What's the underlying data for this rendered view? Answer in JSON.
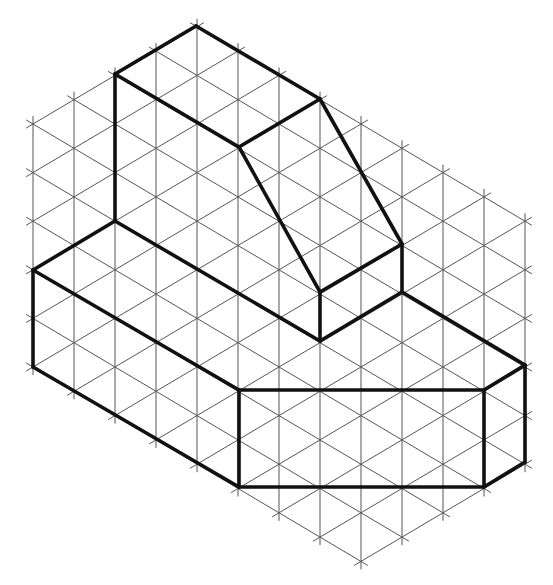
{
  "diagram": {
    "type": "isometric-drawing",
    "background_color": "#ffffff",
    "grid": {
      "origin_x": 33,
      "origin_y": 124,
      "column_spacing": 41,
      "row_height": 48.6,
      "columns": 12,
      "rows": 13,
      "region": "0<=u<=12, m>=0, m>=u-4, m<=13, m<=u+5",
      "line_color": "#555555",
      "line_width": 1,
      "tick_overhang": 8
    },
    "bold_lines": {
      "color": "#111111",
      "width": 3.6,
      "segments": [
        [
          [
            115,
            74
          ],
          [
            196,
            26
          ]
        ],
        [
          [
            196,
            26
          ],
          [
            320,
            99
          ]
        ],
        [
          [
            320,
            99
          ],
          [
            239,
            147
          ]
        ],
        [
          [
            239,
            147
          ],
          [
            115,
            74
          ]
        ],
        [
          [
            115,
            74
          ],
          [
            115,
            221
          ]
        ],
        [
          [
            239,
            147
          ],
          [
            320,
            292
          ]
        ],
        [
          [
            320,
            99
          ],
          [
            402,
            244
          ]
        ],
        [
          [
            320,
            292
          ],
          [
            402,
            244
          ]
        ],
        [
          [
            402,
            244
          ],
          [
            402,
            292
          ]
        ],
        [
          [
            320,
            292
          ],
          [
            320,
            341
          ]
        ],
        [
          [
            320,
            341
          ],
          [
            402,
            292
          ]
        ],
        [
          [
            402,
            292
          ],
          [
            525,
            365
          ]
        ],
        [
          [
            115,
            221
          ],
          [
            320,
            341
          ]
        ],
        [
          [
            115,
            221
          ],
          [
            33,
            270
          ]
        ],
        [
          [
            33,
            270
          ],
          [
            239,
            390
          ]
        ],
        [
          [
            33,
            270
          ],
          [
            33,
            367
          ]
        ],
        [
          [
            33,
            367
          ],
          [
            239,
            487
          ]
        ],
        [
          [
            239,
            390
          ],
          [
            484,
            390
          ]
        ],
        [
          [
            239,
            390
          ],
          [
            239,
            487
          ]
        ],
        [
          [
            239,
            487
          ],
          [
            484,
            487
          ]
        ],
        [
          [
            484,
            390
          ],
          [
            484,
            487
          ]
        ],
        [
          [
            484,
            390
          ],
          [
            525,
            365
          ]
        ],
        [
          [
            525,
            365
          ],
          [
            525,
            462
          ]
        ],
        [
          [
            484,
            487
          ],
          [
            525,
            462
          ]
        ]
      ]
    }
  }
}
